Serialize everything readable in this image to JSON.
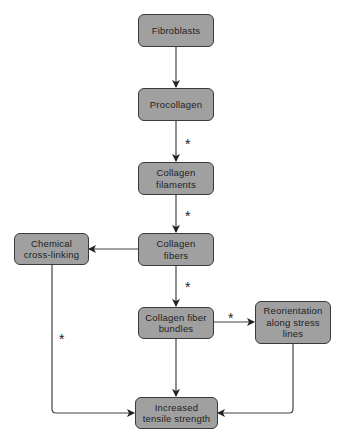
{
  "diagram": {
    "type": "flowchart",
    "colors": {
      "node_fill": "#a0a0a0",
      "node_border": "#3a3a3a",
      "edge": "#444444",
      "background": "#ffffff"
    },
    "nodes": {
      "fibroblasts": "Fibroblasts",
      "procollagen": "Procollagen",
      "filaments": "Collagen\nfilaments",
      "fibers": "Collagen\nfibers",
      "crosslinking": "Chemical\ncross-linking",
      "bundles": "Collagen fiber\nbundles",
      "reorientation": "Reorientation\nalong stress\nlines",
      "strength": "Increased\ntensile strength"
    },
    "edges": [
      {
        "from": "fibroblasts",
        "to": "procollagen",
        "marker": ""
      },
      {
        "from": "procollagen",
        "to": "filaments",
        "marker": "*"
      },
      {
        "from": "filaments",
        "to": "fibers",
        "marker": "*"
      },
      {
        "from": "fibers",
        "to": "crosslinking",
        "marker": ""
      },
      {
        "from": "fibers",
        "to": "bundles",
        "marker": "*"
      },
      {
        "from": "bundles",
        "to": "reorientation",
        "marker": "*"
      },
      {
        "from": "crosslinking",
        "to": "strength",
        "marker": "*"
      },
      {
        "from": "bundles",
        "to": "strength",
        "marker": ""
      },
      {
        "from": "reorientation",
        "to": "strength",
        "marker": ""
      }
    ],
    "markers": {
      "star": "*"
    }
  }
}
